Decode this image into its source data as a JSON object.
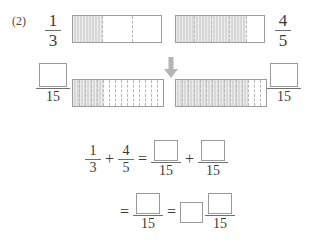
{
  "problem": {
    "number": "(2)",
    "topic_icon": "down-arrow-icon"
  },
  "row1": {
    "left_fraction": {
      "numerator": "1",
      "denominator": "3"
    },
    "right_fraction": {
      "numerator": "4",
      "denominator": "5"
    },
    "left_bar": {
      "total_parts": 3,
      "shaded_parts": 1
    },
    "right_bar": {
      "total_parts": 5,
      "shaded_parts": 4
    }
  },
  "row2": {
    "left_fraction": {
      "numerator": "",
      "denominator": "15"
    },
    "right_fraction": {
      "numerator": "",
      "denominator": "15"
    },
    "left_bar": {
      "total_parts": 15,
      "shaded_parts": 5
    },
    "right_bar": {
      "total_parts": 15,
      "shaded_parts": 12
    }
  },
  "equation_line_1": {
    "term1": {
      "numerator": "1",
      "denominator": "3"
    },
    "plus": "+",
    "term2": {
      "numerator": "4",
      "denominator": "5"
    },
    "equals": "=",
    "term3": {
      "numerator": "",
      "denominator": "15"
    },
    "plus2": "+",
    "term4": {
      "numerator": "",
      "denominator": "15"
    }
  },
  "equation_line_2": {
    "equals1": "=",
    "term1": {
      "numerator": "",
      "denominator": "15"
    },
    "equals2": "=",
    "mixed": {
      "whole": "",
      "numerator": "",
      "denominator": "15"
    }
  },
  "colors": {
    "shaded": "#d8d8d8",
    "outline": "#9c9c9c",
    "box_outline": "#9a9a9a",
    "text": "#3a3a3a",
    "arrow": "#b0b0b0"
  }
}
